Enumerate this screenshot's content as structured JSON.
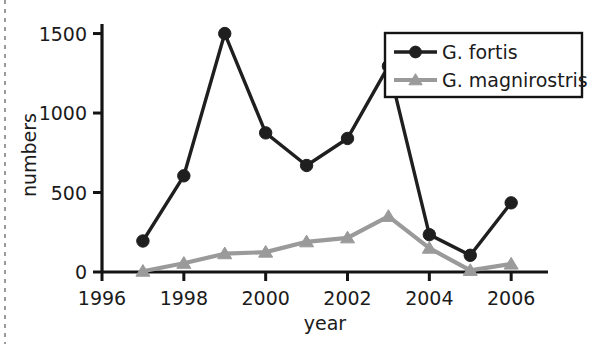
{
  "chart_data": {
    "type": "line",
    "title": "",
    "xlabel": "year",
    "ylabel": "numbers",
    "x": [
      1997,
      1998,
      1999,
      2000,
      2001,
      2002,
      2003,
      2004,
      2005,
      2006
    ],
    "xlim": [
      1996,
      2006.9
    ],
    "ylim": [
      0,
      1560
    ],
    "xticks": [
      1996,
      1998,
      2000,
      2002,
      2004,
      2006
    ],
    "xticklabels": [
      "1996",
      "1998",
      "2000",
      "2002",
      "2004",
      "2006"
    ],
    "yticks": [
      0,
      500,
      1000,
      1500
    ],
    "yticklabels": [
      "0",
      "500",
      "1000",
      "1500"
    ],
    "grid": false,
    "legend_position": "upper right",
    "series": [
      {
        "name": "G. fortis",
        "color": "#1f1f1f",
        "marker": "circle",
        "values": [
          195,
          605,
          1500,
          875,
          670,
          840,
          1295,
          235,
          105,
          435
        ]
      },
      {
        "name": "G. magnirostris",
        "color": "#9a9a9a",
        "marker": "triangle",
        "values": [
          5,
          55,
          115,
          125,
          190,
          215,
          350,
          150,
          10,
          50
        ]
      }
    ]
  },
  "legend": {
    "entries": [
      {
        "label": "G. fortis"
      },
      {
        "label": "G. magnirostris"
      }
    ]
  },
  "axes": {
    "x_title": "year",
    "y_title": "numbers"
  }
}
